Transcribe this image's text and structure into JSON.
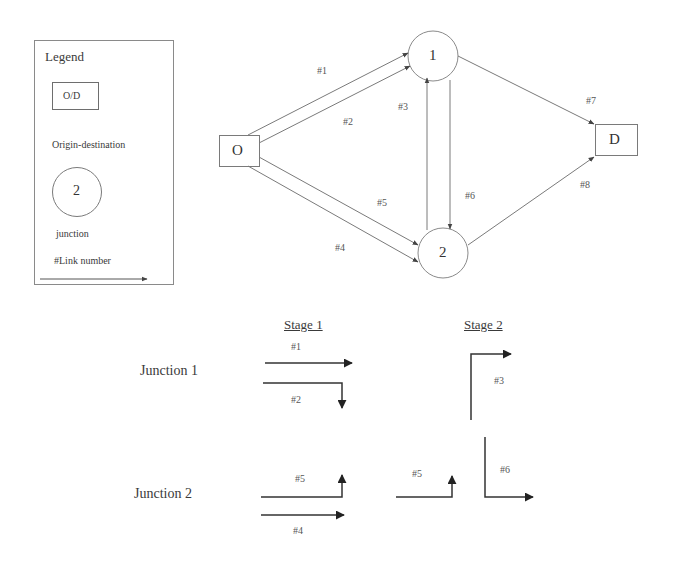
{
  "legend": {
    "title": "Legend",
    "od_box_label": "O/D",
    "od_caption": "Origin-destination",
    "junction_symbol_label": "2",
    "junction_caption": "junction",
    "link_caption": "#Link number"
  },
  "network": {
    "nodes": [
      {
        "id": "O",
        "label": "O",
        "type": "origin-destination"
      },
      {
        "id": "1",
        "label": "1",
        "type": "junction"
      },
      {
        "id": "2",
        "label": "2",
        "type": "junction"
      },
      {
        "id": "D",
        "label": "D",
        "type": "origin-destination"
      }
    ],
    "links": [
      {
        "id": "#1",
        "label": "#1",
        "from": "O",
        "to": "1"
      },
      {
        "id": "#2",
        "label": "#2",
        "from": "O",
        "to": "1"
      },
      {
        "id": "#3",
        "label": "#3",
        "from": "2",
        "to": "1"
      },
      {
        "id": "#4",
        "label": "#4",
        "from": "O",
        "to": "2"
      },
      {
        "id": "#5",
        "label": "#5",
        "from": "O",
        "to": "2"
      },
      {
        "id": "#6",
        "label": "#6",
        "from": "1",
        "to": "2"
      },
      {
        "id": "#7",
        "label": "#7",
        "from": "1",
        "to": "D"
      },
      {
        "id": "#8",
        "label": "#8",
        "from": "2",
        "to": "D"
      }
    ]
  },
  "signal_plan": {
    "stages": [
      "Stage 1",
      "Stage 2"
    ],
    "junctions": [
      {
        "label": "Junction 1",
        "stage1": [
          {
            "label": "#1",
            "movement": "through"
          },
          {
            "label": "#2",
            "movement": "right-turn"
          }
        ],
        "stage2": [
          {
            "label": "#3",
            "movement": "right-turn"
          }
        ]
      },
      {
        "label": "Junction 2",
        "stage1": [
          {
            "label": "#5",
            "movement": "left-turn"
          },
          {
            "label": "#4",
            "movement": "through"
          }
        ],
        "stage2": [
          {
            "label": "#5",
            "movement": "left-turn"
          },
          {
            "label": "#6",
            "movement": "left-turn"
          }
        ]
      }
    ]
  },
  "colors": {
    "stroke": "#7a7a7a",
    "stage_arrow": "#333333",
    "text": "#3a3a3a"
  }
}
